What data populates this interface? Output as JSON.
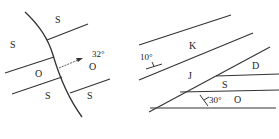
{
  "diagrams": [
    {
      "id": "left",
      "labels": {
        "s_upper": "S",
        "s_left": "S",
        "o_left": "O",
        "o_right": "O",
        "s_lower_left": "S",
        "s_lower_right": "S"
      },
      "arrow_angle": "32°"
    },
    {
      "id": "right",
      "labels": {
        "k": "K",
        "j": "J",
        "d": "D",
        "s": "S",
        "o": "O"
      },
      "dip_upper": "10°",
      "dip_lower": "30°"
    }
  ],
  "colors": {
    "line": "#333333",
    "text": "#222222",
    "background": "#ffffff"
  }
}
